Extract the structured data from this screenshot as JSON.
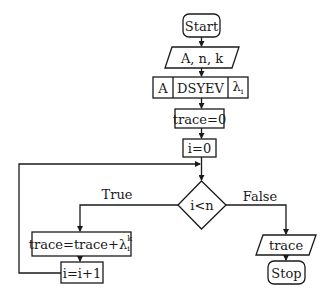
{
  "flowchart": {
    "start": {
      "label": "Start"
    },
    "input": {
      "label": "A, n, k"
    },
    "dsyev": {
      "input_label": "A",
      "routine_label": "DSYEV",
      "output_label": "λ",
      "output_subscript": "i"
    },
    "init_trace": {
      "label": "trace=0"
    },
    "init_i": {
      "label": "i=0"
    },
    "decision": {
      "label": "i<n"
    },
    "branch_true": {
      "label": "True"
    },
    "branch_false": {
      "label": "False"
    },
    "accumulate": {
      "label_prefix": "trace=trace+λ",
      "superscript": "k",
      "subscript": "i"
    },
    "increment": {
      "label": "i=i+1"
    },
    "output": {
      "label": "trace"
    },
    "stop": {
      "label": "Stop"
    }
  },
  "colors": {
    "stroke": "#1a1a1a",
    "background": "#ffffff"
  }
}
